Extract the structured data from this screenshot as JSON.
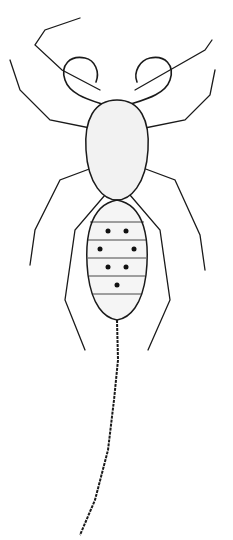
{
  "image": {
    "subject": "whip scorpion (uropygid) scientific line illustration",
    "background": "#ffffff",
    "ink": "#1a1a1a",
    "abdomen_spots": 7,
    "has_whip_tail": true,
    "signature": ""
  }
}
